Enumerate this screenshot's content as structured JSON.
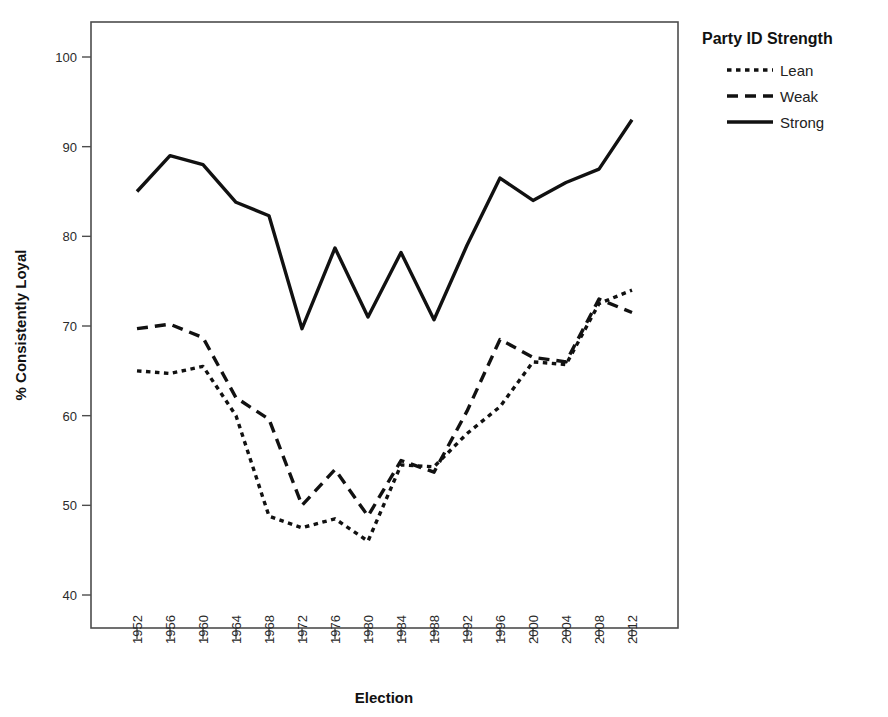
{
  "chart_data": {
    "type": "line",
    "title": "",
    "xlabel": "Election",
    "ylabel": "% Consistently Loyal",
    "categories": [
      "1952",
      "1956",
      "1960",
      "1964",
      "1968",
      "1972",
      "1976",
      "1980",
      "1984",
      "1988",
      "1992",
      "1996",
      "2000",
      "2004",
      "2008",
      "2012"
    ],
    "x_tick_labels": [
      "1952",
      "1956",
      "1960",
      "1964",
      "1968",
      "1972",
      "1976",
      "1980",
      "1984",
      "1988",
      "1992",
      "1996",
      "2000",
      "2004",
      "2008",
      "2012"
    ],
    "y_tick_labels": [
      "40",
      "50",
      "60",
      "70",
      "80",
      "90",
      "100"
    ],
    "y_ticks": [
      40,
      50,
      60,
      70,
      80,
      90,
      100
    ],
    "ylim": [
      36,
      103
    ],
    "grid": false,
    "legend_position": "top-right-outside",
    "legend_title": "Party ID Strength",
    "series": [
      {
        "name": "Lean",
        "style": "dotted",
        "values": [
          65.0,
          64.7,
          65.5,
          60.0,
          48.8,
          47.5,
          48.5,
          46.0,
          54.5,
          54.3,
          58.0,
          61.0,
          66.0,
          65.7,
          72.5,
          74.0
        ]
      },
      {
        "name": "Weak",
        "style": "dashed",
        "values": [
          69.7,
          70.2,
          68.7,
          62.0,
          59.6,
          50.0,
          54.0,
          48.8,
          55.0,
          53.7,
          60.5,
          68.5,
          66.5,
          66.0,
          73.0,
          71.5
        ]
      },
      {
        "name": "Strong",
        "style": "solid",
        "values": [
          85.0,
          89.0,
          88.0,
          83.8,
          82.3,
          69.7,
          78.7,
          71.0,
          78.2,
          70.7,
          79.0,
          86.5,
          84.0,
          86.0,
          87.5,
          93.0
        ]
      }
    ]
  },
  "legend": {
    "title": "Party ID Strength",
    "entries": [
      {
        "label": "Lean",
        "style": "dotted"
      },
      {
        "label": "Weak",
        "style": "dashed"
      },
      {
        "label": "Strong",
        "style": "solid"
      }
    ]
  },
  "axes": {
    "x_title": "Election",
    "y_title": "% Consistently Loyal"
  },
  "colors": {
    "line": "#111111",
    "frame": "#4d4d4d",
    "background": "#ffffff",
    "text": "#111111"
  }
}
